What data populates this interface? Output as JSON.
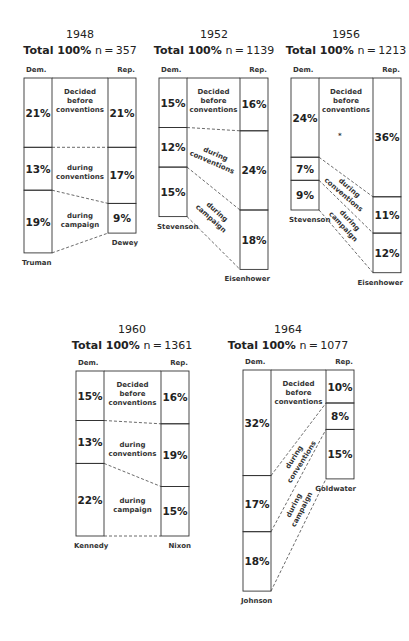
{
  "chart_data": {
    "type": "table",
    "column_labels": {
      "dem": "Dem.",
      "rep": "Rep."
    },
    "phase_labels": {
      "before": "Decided before conventions",
      "conventions": "during conventions",
      "campaign": "during campaign"
    },
    "total_label": "Total 100%",
    "panels": [
      {
        "year": "1948",
        "n": "n = 357",
        "dem_candidate": "Truman",
        "rep_candidate": "Dewey",
        "dem": {
          "before": 21,
          "conventions": 13,
          "campaign": 19
        },
        "rep": {
          "before": 21,
          "conventions": 17,
          "campaign": 9
        }
      },
      {
        "year": "1952",
        "n": "n = 1139",
        "dem_candidate": "Stevenson",
        "rep_candidate": "Eisenhower",
        "dem": {
          "before": 15,
          "conventions": 12,
          "campaign": 15
        },
        "rep": {
          "before": 16,
          "conventions": 24,
          "campaign": 18
        }
      },
      {
        "year": "1956",
        "n": "n = 1213",
        "dem_candidate": "Stevenson",
        "rep_candidate": "Eisenhower",
        "dem": {
          "before": 24,
          "conventions": 7,
          "campaign": 9
        },
        "rep": {
          "before": 36,
          "conventions": 11,
          "campaign": 12
        },
        "annotation": "*"
      },
      {
        "year": "1960",
        "n": "n = 1361",
        "dem_candidate": "Kennedy",
        "rep_candidate": "Nixon",
        "dem": {
          "before": 15,
          "conventions": 13,
          "campaign": 22
        },
        "rep": {
          "before": 16,
          "conventions": 19,
          "campaign": 15
        }
      },
      {
        "year": "1964",
        "n": "n = 1077",
        "dem_candidate": "Johnson",
        "rep_candidate": "Goldwater",
        "dem": {
          "before": 32,
          "conventions": 17,
          "campaign": 18
        },
        "rep": {
          "before": 10,
          "conventions": 8,
          "campaign": 15
        }
      }
    ]
  }
}
